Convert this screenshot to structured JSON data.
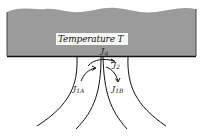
{
  "diagram": {
    "reservoir": {
      "label": "Temperature T",
      "fill_color": "#9a9a9a",
      "edge_color": "#222222"
    },
    "flows": [
      {
        "id": "Jq",
        "symbol": "J",
        "subscript": "q",
        "description": "heat flux into reservoir"
      },
      {
        "id": "J2",
        "symbol": "J",
        "subscript": "2"
      },
      {
        "id": "J1A",
        "symbol": "J",
        "subscript": "1A"
      },
      {
        "id": "J1B",
        "symbol": "J",
        "subscript": "1B"
      }
    ]
  }
}
